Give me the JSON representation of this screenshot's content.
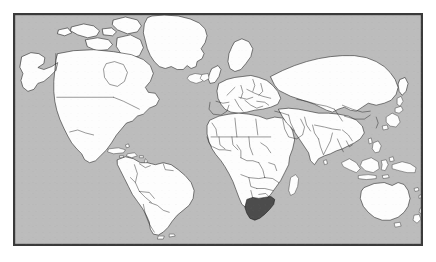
{
  "figure": {
    "title": "World Map",
    "projection": "equirectangular",
    "width": 436,
    "height": 262
  },
  "frame": {
    "name": "map-border",
    "left": 13,
    "top": 13,
    "width": 410,
    "height": 233,
    "border_color": "#3a3a3a",
    "border_width": 1
  },
  "colors": {
    "page_background": "#ffffff",
    "ocean": "#bcbcbc",
    "land": "#fdfdfd",
    "coastline": "#1a1a1a",
    "country_border": "#1a1a1a",
    "highlight_fill": "#4c4c4c",
    "frame": "#3a3a3a"
  },
  "legend": {
    "visible": false,
    "entries": []
  },
  "labels": {
    "visible": false,
    "text": []
  },
  "axes": {
    "visible": false,
    "tick_labels": []
  },
  "highlighted": {
    "name": "South Africa",
    "region": "Southern Africa",
    "fill": "#4c4c4c"
  },
  "continents": [
    {
      "name": "North America"
    },
    {
      "name": "South America"
    },
    {
      "name": "Europe"
    },
    {
      "name": "Africa"
    },
    {
      "name": "Asia"
    },
    {
      "name": "Australia and Oceania"
    },
    {
      "name": "Greenland"
    }
  ],
  "features": {
    "country_borders_shown": true,
    "antarctica_shown": false,
    "graticule_shown": false,
    "coordinates_shown": false
  }
}
